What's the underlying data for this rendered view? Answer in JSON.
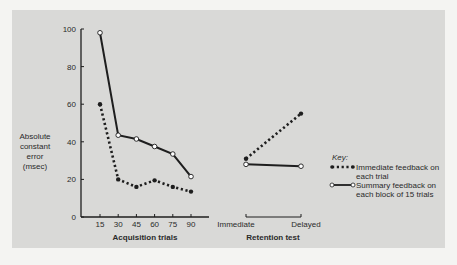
{
  "chart_data": {
    "type": "line",
    "title": "",
    "ylabel": "Absolute constant error (msec)",
    "ylabel_lines": [
      "Absolute",
      "constant",
      "error",
      "(msec)"
    ],
    "ylim": [
      0,
      100
    ],
    "yticks": [
      0,
      20,
      40,
      60,
      80,
      100
    ],
    "grid": false,
    "panels": [
      {
        "name": "acquisition",
        "xlabel": "Acquisition trials",
        "categories": [
          "15",
          "30",
          "45",
          "60",
          "75",
          "90"
        ],
        "series": [
          {
            "name": "Immediate feedback on each trial",
            "style": "dotted",
            "marker": "filled",
            "values": [
              60,
              20,
              16,
              19.5,
              16,
              13.5
            ]
          },
          {
            "name": "Summary feedback on each block of 15 trials",
            "style": "solid",
            "marker": "open",
            "values": [
              98,
              43.5,
              41.5,
              37.5,
              33.5,
              21.5
            ]
          }
        ]
      },
      {
        "name": "retention",
        "xlabel": "Retention test",
        "categories": [
          "Immediate",
          "Delayed"
        ],
        "series": [
          {
            "name": "Immediate feedback on each trial",
            "style": "dotted",
            "marker": "filled",
            "values": [
              31,
              55
            ]
          },
          {
            "name": "Summary feedback on each block of 15 trials",
            "style": "solid",
            "marker": "open",
            "values": [
              28,
              27
            ]
          }
        ]
      }
    ],
    "legend": {
      "title": "Key:",
      "position": "right",
      "entries": [
        {
          "label_lines": [
            "Immediate feedback on",
            "each trial"
          ],
          "style": "dotted",
          "marker": "filled"
        },
        {
          "label_lines": [
            "Summary feedback on",
            "each block of 15 trials"
          ],
          "style": "solid",
          "marker": "open"
        }
      ]
    }
  },
  "colors": {
    "panel": "#d9d9d7",
    "ink": "#1e1e1e",
    "background": "#f4f4f2"
  }
}
